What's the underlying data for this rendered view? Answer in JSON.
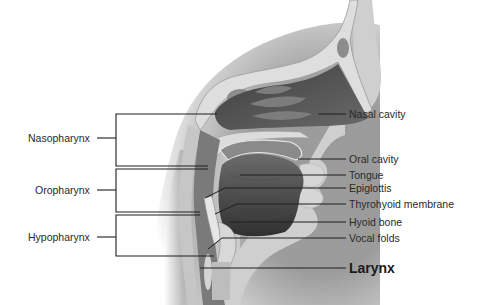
{
  "figure": {
    "type": "anatomical-sagittal-section"
  },
  "left_labels": [
    {
      "id": "nasopharynx",
      "text": "Nasopharynx"
    },
    {
      "id": "oropharynx",
      "text": "Oropharynx"
    },
    {
      "id": "hypopharynx",
      "text": "Hypopharynx"
    }
  ],
  "right_labels": [
    {
      "id": "nasal-cavity",
      "text": "Nasal cavity"
    },
    {
      "id": "oral-cavity",
      "text": "Oral cavity"
    },
    {
      "id": "tongue",
      "text": "Tongue"
    },
    {
      "id": "epiglottis",
      "text": "Epiglottis"
    },
    {
      "id": "thyrohyoid-membrane",
      "text": "Thyrohyoid membrane"
    },
    {
      "id": "hyoid-bone",
      "text": "Hyoid bone"
    },
    {
      "id": "vocal-folds",
      "text": "Vocal folds"
    },
    {
      "id": "larynx",
      "text": "Larynx"
    }
  ],
  "colors": {
    "background": "#ffffff",
    "bone": "#dcdcdc",
    "soft_tissue": "#c8c8c8",
    "dark_cavity": "#555555",
    "airway": "#9a9a9a",
    "line": "#1e1e1e",
    "text": "#2a2a2a"
  }
}
